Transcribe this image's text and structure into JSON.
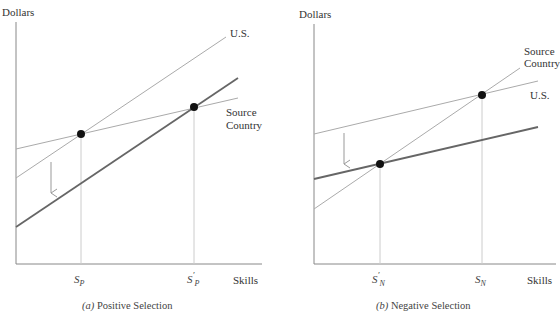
{
  "panels": [
    {
      "id": "a",
      "caption_letter": "(a)",
      "caption_text": " Positive Selection",
      "ylabel": "Dollars",
      "xlabel": "Skills",
      "line_labels": {
        "us": "U.S.",
        "source_line1": "Source",
        "source_line2": "Country"
      },
      "ticks": [
        {
          "base": "S",
          "sub": "P",
          "prime": ""
        },
        {
          "base": "S",
          "sub": "P",
          "prime": "′"
        }
      ]
    },
    {
      "id": "b",
      "caption_letter": "(b)",
      "caption_text": " Negative Selection",
      "ylabel": "Dollars",
      "xlabel": "Skills",
      "line_labels": {
        "us": "U.S.",
        "source_line1": "Source",
        "source_line2": "Country"
      },
      "ticks": [
        {
          "base": "S",
          "sub": "N",
          "prime": "′"
        },
        {
          "base": "S",
          "sub": "N",
          "prime": ""
        }
      ]
    }
  ],
  "colors": {
    "axis": "#888888",
    "thin_line": "#aaaaaa",
    "thick_line": "#666666",
    "dot": "#111111",
    "guide": "#cccccc"
  }
}
